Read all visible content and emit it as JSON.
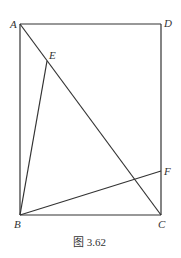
{
  "figure": {
    "caption": "图 3.62",
    "points": {
      "A": {
        "label": "A",
        "x": 20,
        "y": 24
      },
      "D": {
        "label": "D",
        "x": 161,
        "y": 24
      },
      "B": {
        "label": "B",
        "x": 20,
        "y": 215
      },
      "C": {
        "label": "C",
        "x": 161,
        "y": 215
      },
      "E": {
        "label": "E",
        "x": 47,
        "y": 61
      },
      "F": {
        "label": "F",
        "x": 161,
        "y": 171
      }
    },
    "segments": [
      "AD",
      "DC",
      "CB",
      "BA",
      "AC",
      "BE",
      "BF"
    ],
    "stroke_color": "#333333"
  }
}
